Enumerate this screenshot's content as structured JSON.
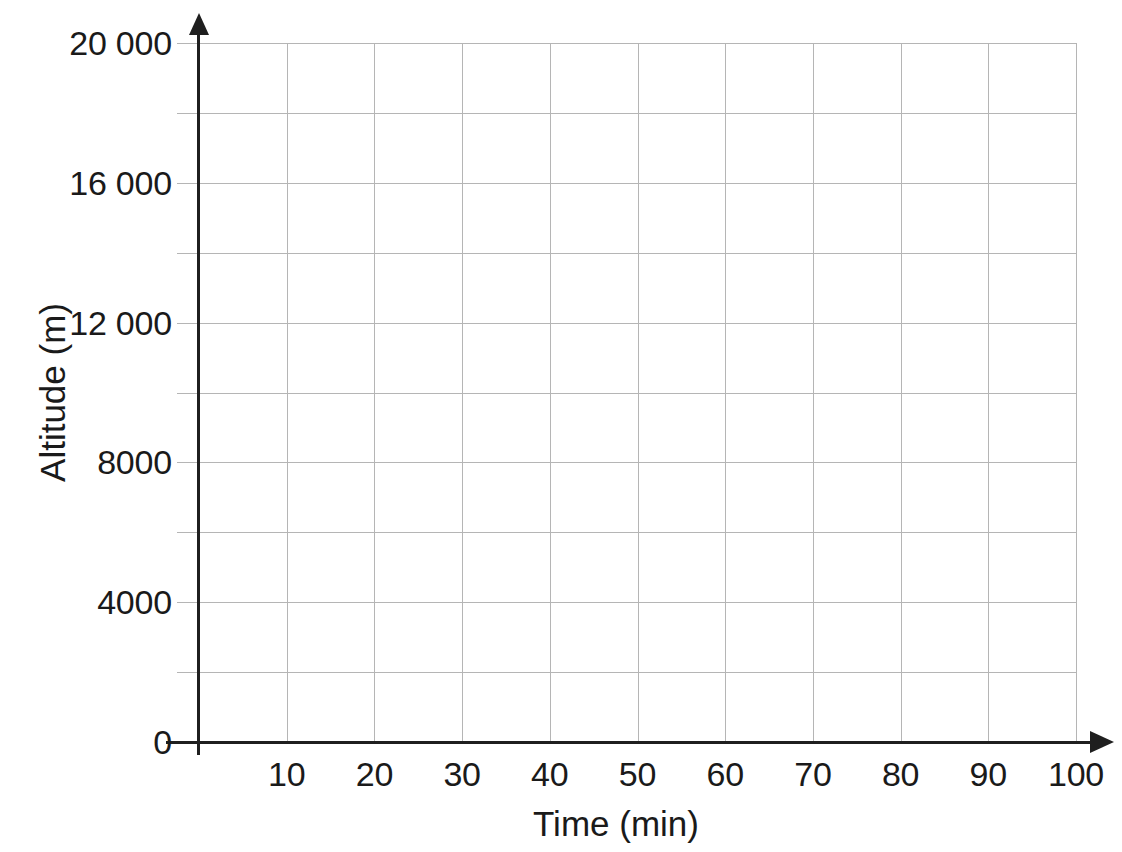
{
  "chart_data": {
    "type": "line",
    "title": "",
    "subtitle": "",
    "xlabel": "Time (min)",
    "ylabel": "Altitude (m)",
    "xlim": [
      0,
      100
    ],
    "ylim": [
      0,
      20000
    ],
    "grid": true,
    "legend": null,
    "series": [],
    "annotations": [],
    "note": "Empty grid / blank graph paper axes — no data plotted",
    "x_ticks": [
      {
        "value": 0,
        "label": ""
      },
      {
        "value": 10,
        "label": "10"
      },
      {
        "value": 20,
        "label": "20"
      },
      {
        "value": 30,
        "label": "30"
      },
      {
        "value": 40,
        "label": "40"
      },
      {
        "value": 50,
        "label": "50"
      },
      {
        "value": 60,
        "label": "60"
      },
      {
        "value": 70,
        "label": "70"
      },
      {
        "value": 80,
        "label": "80"
      },
      {
        "value": 90,
        "label": "90"
      },
      {
        "value": 100,
        "label": "100"
      }
    ],
    "y_ticks": [
      {
        "value": 0,
        "label": "0"
      },
      {
        "value": 2000,
        "label": ""
      },
      {
        "value": 4000,
        "label": "4000"
      },
      {
        "value": 6000,
        "label": ""
      },
      {
        "value": 8000,
        "label": "8000"
      },
      {
        "value": 10000,
        "label": ""
      },
      {
        "value": 12000,
        "label": "12 000"
      },
      {
        "value": 14000,
        "label": ""
      },
      {
        "value": 16000,
        "label": "16 000"
      },
      {
        "value": 18000,
        "label": ""
      },
      {
        "value": 20000,
        "label": "20 000"
      }
    ],
    "x_gridline_step": 10,
    "y_gridline_step": 2000,
    "colors": {
      "background": "#ffffff",
      "gridline": "#b5b5b5",
      "axis": "#1f1f1f",
      "text": "#1a1a1a"
    }
  },
  "axis_titles": {
    "x": "Time (min)",
    "y": "Altitude (m)"
  }
}
